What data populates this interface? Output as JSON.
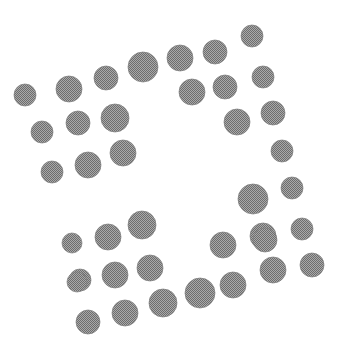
{
  "image": {
    "title": "Scattered Dot Pattern",
    "width": 342,
    "height": 360,
    "background_color": "#ffffff",
    "dot_color": "#8a8a8a",
    "dot_edge_color": "#7c7c7c",
    "texture": "halftone-dither",
    "description": "Monochrome halftone-textured circles of varying size arranged in two curved bands forming an S / pinwheel-like negative space",
    "dot_count": 43
  },
  "chart_data": {
    "type": "scatter",
    "title": "",
    "subtitle": "",
    "xlabel": "",
    "ylabel": "",
    "xlim": [
      0,
      342
    ],
    "ylim": [
      0,
      360
    ],
    "grid": false,
    "legend": null,
    "axes_visible": false,
    "tick_labels": [],
    "annotations": [],
    "marker": "circle",
    "marker_fill": "#8a8a8a",
    "series": [
      {
        "name": "upper-band",
        "points": [
          {
            "x": 25,
            "y": 95,
            "r": 11
          },
          {
            "x": 42,
            "y": 132,
            "r": 11
          },
          {
            "x": 52,
            "y": 172,
            "r": 11
          },
          {
            "x": 69,
            "y": 89,
            "r": 13
          },
          {
            "x": 78,
            "y": 123,
            "r": 12
          },
          {
            "x": 88,
            "y": 165,
            "r": 13
          },
          {
            "x": 106,
            "y": 78,
            "r": 12
          },
          {
            "x": 115,
            "y": 118,
            "r": 14
          },
          {
            "x": 123,
            "y": 153,
            "r": 13
          },
          {
            "x": 143,
            "y": 67,
            "r": 15
          },
          {
            "x": 180,
            "y": 58,
            "r": 13
          },
          {
            "x": 192,
            "y": 92,
            "r": 13
          },
          {
            "x": 215,
            "y": 52,
            "r": 12
          },
          {
            "x": 225,
            "y": 87,
            "r": 12
          },
          {
            "x": 252,
            "y": 36,
            "r": 11
          },
          {
            "x": 237,
            "y": 122,
            "r": 13
          },
          {
            "x": 263,
            "y": 77,
            "r": 11
          },
          {
            "x": 273,
            "y": 113,
            "r": 12
          },
          {
            "x": 282,
            "y": 151,
            "r": 11
          }
        ]
      },
      {
        "name": "lower-band",
        "points": [
          {
            "x": 253,
            "y": 199,
            "r": 15
          },
          {
            "x": 292,
            "y": 188,
            "r": 11
          },
          {
            "x": 302,
            "y": 229,
            "r": 11
          },
          {
            "x": 263,
            "y": 236,
            "r": 13
          },
          {
            "x": 223,
            "y": 245,
            "r": 13
          },
          {
            "x": 273,
            "y": 270,
            "r": 13
          },
          {
            "x": 312,
            "y": 265,
            "r": 12
          },
          {
            "x": 72,
            "y": 243,
            "r": 10
          },
          {
            "x": 108,
            "y": 237,
            "r": 13
          },
          {
            "x": 142,
            "y": 225,
            "r": 14
          },
          {
            "x": 80,
            "y": 280,
            "r": 11
          },
          {
            "x": 115,
            "y": 275,
            "r": 13
          },
          {
            "x": 150,
            "y": 268,
            "r": 13
          },
          {
            "x": 77,
            "y": 282,
            "r": 10
          },
          {
            "x": 163,
            "y": 303,
            "r": 14
          },
          {
            "x": 125,
            "y": 313,
            "r": 13
          },
          {
            "x": 88,
            "y": 322,
            "r": 12
          },
          {
            "x": 200,
            "y": 293,
            "r": 15
          },
          {
            "x": 233,
            "y": 285,
            "r": 13
          },
          {
            "x": 265,
            "y": 240,
            "r": 12
          }
        ]
      }
    ]
  }
}
